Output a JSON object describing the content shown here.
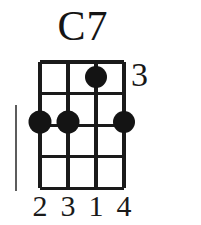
{
  "diagram": {
    "title": "C7",
    "instrument_strings": 4,
    "fret_count": 5,
    "position_marker": "3",
    "left_bar": true,
    "geometry": {
      "grid_left": 40,
      "grid_right": 124,
      "grid_top": 62,
      "grid_bottom": 188,
      "string_spacing": 28,
      "fret_spacing": 31.5,
      "dot_radius": 10,
      "line_color": "#1a1a1a",
      "dot_color": "#141414",
      "background": "#ffffff"
    },
    "strings": [
      {
        "index": 1,
        "x": 40
      },
      {
        "index": 2,
        "x": 68
      },
      {
        "index": 3,
        "x": 96
      },
      {
        "index": 4,
        "x": 124
      }
    ],
    "frets": [
      {
        "index": 0,
        "y": 62
      },
      {
        "index": 1,
        "y": 93.5
      },
      {
        "index": 2,
        "y": 125
      },
      {
        "index": 3,
        "y": 156.5
      },
      {
        "index": 4,
        "y": 188
      }
    ],
    "dots": [
      {
        "id": "dot-s3-f1",
        "string": 3,
        "fret": 1,
        "cx": 96,
        "cy": 77,
        "finger": "1"
      },
      {
        "id": "dot-s1-f3",
        "string": 1,
        "fret": 3,
        "cx": 40,
        "cy": 122,
        "finger": "2"
      },
      {
        "id": "dot-s2-f3",
        "string": 2,
        "fret": 3,
        "cx": 68,
        "cy": 122,
        "finger": "3"
      },
      {
        "id": "dot-s4-f3",
        "string": 4,
        "fret": 3,
        "cx": 124,
        "cy": 122,
        "finger": "4"
      }
    ],
    "finger_numbers": [
      {
        "label": "2",
        "x": 40
      },
      {
        "label": "3",
        "x": 68
      },
      {
        "label": "1",
        "x": 96
      },
      {
        "label": "4",
        "x": 124
      }
    ]
  }
}
